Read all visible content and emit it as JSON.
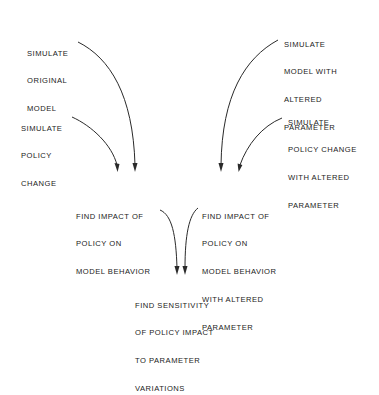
{
  "diagram": {
    "type": "flowchart",
    "nodes": [
      {
        "id": "sim-original",
        "lines": [
          "SIMULATE",
          "ORIGINAL",
          "MODEL"
        ]
      },
      {
        "id": "sim-policy",
        "lines": [
          "SIMULATE",
          "POLICY",
          "CHANGE"
        ]
      },
      {
        "id": "sim-altered",
        "lines": [
          "SIMULATE",
          "MODEL WITH",
          "ALTERED",
          "PARAMETER"
        ]
      },
      {
        "id": "sim-policy-altered",
        "lines": [
          "SIMULATE",
          "POLICY CHANGE",
          "WITH ALTERED",
          "PARAMETER"
        ]
      },
      {
        "id": "impact",
        "lines": [
          "FIND IMPACT OF",
          "POLICY ON",
          "MODEL BEHAVIOR"
        ]
      },
      {
        "id": "impact-altered",
        "lines": [
          "FIND IMPACT OF",
          "POLICY ON",
          "MODEL BEHAVIOR",
          "WITH ALTERED",
          "PARAMETER"
        ]
      },
      {
        "id": "sensitivity",
        "lines": [
          "FIND SENSITIVITY",
          "OF POLICY IMPACT",
          "TO PARAMETER",
          "VARIATIONS"
        ]
      }
    ],
    "edges": [
      {
        "from": "sim-original",
        "to": "impact"
      },
      {
        "from": "sim-policy",
        "to": "impact"
      },
      {
        "from": "sim-altered",
        "to": "impact-altered"
      },
      {
        "from": "sim-policy-altered",
        "to": "impact-altered"
      },
      {
        "from": "impact",
        "to": "sensitivity"
      },
      {
        "from": "impact-altered",
        "to": "sensitivity"
      }
    ],
    "colors": {
      "ink": "#222222",
      "background": "#ffffff"
    }
  }
}
